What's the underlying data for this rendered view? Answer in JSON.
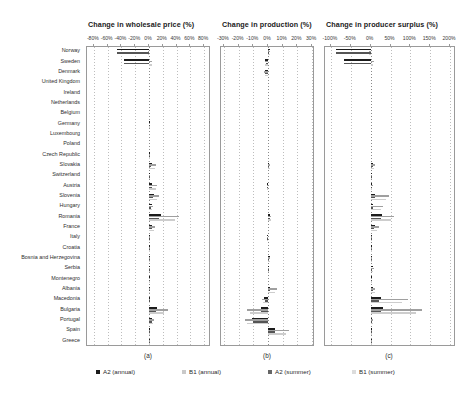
{
  "chart_data": {
    "type": "bar",
    "orientation": "horizontal",
    "title": "",
    "grid": true,
    "legend_position": "bottom",
    "legend": [
      "A2 (annual)",
      "B1 (annual)",
      "A2 (summer)",
      "B1 (summer)"
    ],
    "series_colors": [
      "#1c1c1c",
      "#c9c9c9",
      "#666666",
      "#dcdcdc"
    ],
    "categories": [
      "Norway",
      "Sweden",
      "Denmark",
      "United Kingdom",
      "Ireland",
      "Netherlands",
      "Belgium",
      "Germany",
      "Luxembourg",
      "Poland",
      "Czech Republic",
      "Slovakia",
      "Switzerland",
      "Austria",
      "Slovenia",
      "Hungary",
      "Romania",
      "France",
      "Italy",
      "Croatia",
      "Bosnia and Herzegovina",
      "Serbia",
      "Montenegro",
      "Albania",
      "Macedonia",
      "Bulgaria",
      "Portugal",
      "Spain",
      "Greece"
    ],
    "panels": [
      {
        "key": "wholesale_price",
        "letter": "(a)",
        "title": "Change in wholesale price (%)",
        "xlabel": "",
        "ylabel": "",
        "xlim": [
          -90,
          90
        ],
        "ticks": [
          -80,
          -60,
          -40,
          -20,
          0,
          20,
          40,
          60,
          80
        ],
        "tick_labels": [
          "-80%",
          "-60%",
          "-40%",
          "-20%",
          "0%",
          "20%",
          "40%",
          "60%",
          "80%"
        ],
        "series": [
          {
            "name": "A2 (annual)",
            "values": [
              -46,
              -36,
              0,
              0,
              0,
              0,
              0,
              0.5,
              0,
              0,
              0.5,
              4.5,
              1.5,
              5.0,
              7.5,
              4.0,
              17.0,
              5.0,
              1.0,
              0.5,
              0.5,
              0.5,
              0.5,
              0.5,
              1.0,
              12.0,
              5.0,
              0.5,
              1.0
            ]
          },
          {
            "name": "B1 (annual)",
            "values": [
              -1.5,
              5.0,
              0,
              0,
              0,
              0,
              0,
              0.3,
              0,
              0,
              0.3,
              10.0,
              2.0,
              12.0,
              14.0,
              6.0,
              43.0,
              9.0,
              1.5,
              0.5,
              0.5,
              0.5,
              0.5,
              0.5,
              1.5,
              27.0,
              7.0,
              0.5,
              1.5
            ]
          },
          {
            "name": "A2 (summer)",
            "values": [
              -46,
              -36,
              0,
              0,
              0,
              0,
              0,
              0.4,
              0,
              0,
              0.4,
              3.5,
              1.2,
              4.0,
              6.0,
              3.0,
              15.0,
              4.0,
              0.8,
              0.4,
              0.4,
              0.4,
              0.4,
              0.4,
              0.8,
              10.0,
              4.0,
              0.4,
              0.8
            ]
          },
          {
            "name": "B1 (summer)",
            "values": [
              -1.0,
              4.0,
              0,
              0,
              0,
              0,
              0,
              0.2,
              0,
              0,
              0.2,
              8.0,
              1.5,
              10.0,
              12.0,
              5.0,
              38.0,
              7.5,
              1.2,
              0.4,
              0.4,
              0.4,
              0.4,
              0.4,
              1.2,
              22.0,
              6.0,
              0.4,
              1.2
            ]
          }
        ]
      },
      {
        "key": "production",
        "letter": "(b)",
        "title": "Change in production (%)",
        "xlabel": "",
        "ylabel": "",
        "xlim": [
          -32,
          32
        ],
        "ticks": [
          -30,
          -20,
          -10,
          0,
          10,
          20,
          30
        ],
        "tick_labels": [
          "-30%",
          "-20%",
          "-10%",
          "0%",
          "10%",
          "20%",
          "30%"
        ],
        "series": [
          {
            "name": "A2 (annual)",
            "values": [
              1.2,
              -1.8,
              -2.0,
              0,
              0,
              0,
              0,
              0,
              0,
              0,
              0,
              1.0,
              0,
              -0.8,
              0,
              0,
              1.5,
              0,
              -0.6,
              0,
              1.2,
              0.8,
              0,
              1.5,
              -2.5,
              -5.0,
              -11.0,
              5.0,
              0,
              0
            ]
          },
          {
            "name": "B1 (annual)",
            "values": [
              1.5,
              -2.2,
              -2.4,
              0,
              0,
              0,
              0,
              0,
              0,
              0,
              0,
              1.6,
              0,
              -1.0,
              0,
              0,
              2.0,
              0,
              -0.8,
              0,
              1.5,
              1.0,
              0,
              6.0,
              -4.0,
              -14.0,
              -16.0,
              14.0,
              0,
              0
            ]
          },
          {
            "name": "A2 (summer)",
            "values": [
              1.0,
              -1.6,
              -1.8,
              0,
              0,
              0,
              0,
              0,
              0,
              0,
              0,
              0.9,
              0,
              -0.7,
              0,
              0,
              1.3,
              0,
              -0.5,
              0,
              1.0,
              0.7,
              0,
              1.2,
              -2.2,
              -4.5,
              -10.0,
              4.5,
              0,
              0
            ]
          },
          {
            "name": "B1 (summer)",
            "values": [
              1.3,
              -2.0,
              -2.1,
              0,
              0,
              0,
              0,
              0,
              0,
              0,
              0,
              1.4,
              0,
              -0.9,
              0,
              0,
              1.8,
              0,
              -0.7,
              0,
              1.3,
              0.9,
              0,
              5.0,
              -3.5,
              -12.0,
              -14.0,
              12.0,
              0,
              0
            ]
          }
        ]
      },
      {
        "key": "producer_surplus",
        "letter": "(c)",
        "title": "Change in producer surplus (%)",
        "xlabel": "",
        "ylabel": "",
        "xlim": [
          -115,
          215
        ],
        "ticks": [
          -100,
          -50,
          0,
          50,
          100,
          150,
          200
        ],
        "tick_labels": [
          "-100%",
          "-50%",
          "0%",
          "50%",
          "100%",
          "150%",
          "200%"
        ],
        "series": [
          {
            "name": "A2 (annual)",
            "values": [
              -88,
              -68,
              0,
              0,
              0,
              0,
              0,
              0,
              0,
              0,
              0,
              6.0,
              1.0,
              3.0,
              12.0,
              7.0,
              28.0,
              10.0,
              2.0,
              1.0,
              1.0,
              5.0,
              1.0,
              7.0,
              25.0,
              30.0,
              4.0,
              1.0,
              1.0
            ]
          },
          {
            "name": "B1 (annual)",
            "values": [
              -5.0,
              9.0,
              0,
              0,
              0,
              0,
              0,
              0,
              0,
              0,
              0,
              10.0,
              1.5,
              5.0,
              45.0,
              30.0,
              60.0,
              20.0,
              3.0,
              1.5,
              1.5,
              9.0,
              1.5,
              12.0,
              95.0,
              130.0,
              7.0,
              1.5,
              1.5
            ]
          },
          {
            "name": "A2 (summer)",
            "values": [
              -88,
              -68,
              0,
              0,
              0,
              0,
              0,
              0,
              0,
              0,
              0,
              5.0,
              0.8,
              2.5,
              10.0,
              6.0,
              25.0,
              8.0,
              1.6,
              0.8,
              0.8,
              4.0,
              0.8,
              6.0,
              22.0,
              27.0,
              3.5,
              0.8,
              0.8
            ]
          },
          {
            "name": "B1 (summer)",
            "values": [
              -4.0,
              7.0,
              0,
              0,
              0,
              0,
              0,
              0,
              0,
              0,
              0,
              8.0,
              1.2,
              4.0,
              38.0,
              25.0,
              52.0,
              17.0,
              2.5,
              1.2,
              1.2,
              7.0,
              1.2,
              10.0,
              80.0,
              115.0,
              6.0,
              1.2,
              1.2
            ]
          }
        ]
      }
    ]
  },
  "layout": {
    "label_col_right": 80,
    "plot_top": 46,
    "plot_height": 300,
    "panels_px": [
      {
        "left": 86,
        "width": 124
      },
      {
        "left": 220,
        "width": 94
      },
      {
        "left": 324,
        "width": 131
      }
    ],
    "title_positions": [
      88,
      222,
      326
    ],
    "letter_positions": [
      148,
      267,
      389
    ],
    "letter_y": 352,
    "legend_y": 368,
    "legend_x": [
      96,
      182,
      268,
      352
    ]
  }
}
